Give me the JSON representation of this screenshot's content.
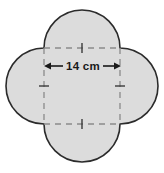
{
  "figure": {
    "shape_name": "four-petal-rosette",
    "fill_color": "#dcdcdc",
    "outline_color": "#2b2b2b",
    "dashed_color": "#8a8a8a",
    "background_color": "#ffffff",
    "square": {
      "side_label": "14 cm",
      "side_value": 14,
      "unit": "cm",
      "style": "dashed",
      "center_x": 82,
      "center_y": 86,
      "side_px": 76
    },
    "dimension": {
      "label": "14 cm",
      "arrow_style": "double-headed",
      "arrow_left_x": 44,
      "arrow_right_x": 121,
      "arrow_y": 66
    },
    "tick_marks": [
      {
        "name": "top-tick",
        "orientation": "vertical"
      },
      {
        "name": "bottom-tick",
        "orientation": "vertical"
      },
      {
        "name": "left-tick",
        "orientation": "horizontal"
      },
      {
        "name": "right-tick",
        "orientation": "horizontal"
      }
    ],
    "semicircles": [
      {
        "name": "top-semicircle",
        "position": "top"
      },
      {
        "name": "right-semicircle",
        "position": "right"
      },
      {
        "name": "bottom-semicircle",
        "position": "bottom"
      },
      {
        "name": "left-semicircle",
        "position": "left"
      }
    ]
  }
}
